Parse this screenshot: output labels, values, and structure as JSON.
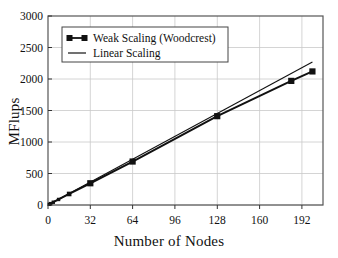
{
  "chart_data": {
    "type": "line",
    "title": "",
    "xlabel": "Number of Nodes",
    "ylabel": "MFlups",
    "xlim": [
      0,
      208
    ],
    "ylim": [
      0,
      3000
    ],
    "xticks": [
      0,
      32,
      64,
      96,
      128,
      160,
      192
    ],
    "yticks": [
      0,
      500,
      1000,
      1500,
      2000,
      2500,
      3000
    ],
    "xtick_labels": [
      "0",
      "32",
      "64",
      "96",
      "128",
      "160",
      "192"
    ],
    "ytick_labels": [
      "0",
      "500",
      "1000",
      "1500",
      "2000",
      "2500",
      "3000"
    ],
    "grid": true,
    "legend_position": "upper-left",
    "series": [
      {
        "name": "Weak Scaling (Woodcrest)",
        "marker": "square",
        "color": "#111111",
        "x": [
          1,
          2,
          4,
          8,
          16,
          32,
          64,
          128,
          184,
          200
        ],
        "y": [
          11,
          22,
          44,
          88,
          175,
          345,
          690,
          1410,
          1970,
          2120
        ]
      },
      {
        "name": "Linear Scaling",
        "marker": "none",
        "color": "#111111",
        "x": [
          0,
          200
        ],
        "y": [
          0,
          2270
        ]
      }
    ]
  },
  "legend": {
    "items": [
      {
        "label": "Weak Scaling (Woodcrest)",
        "style": "line-with-square-marker"
      },
      {
        "label": "Linear Scaling",
        "style": "plain-line"
      }
    ]
  },
  "axes": {
    "x_title": "Number of Nodes",
    "y_title": "MFlups"
  },
  "colors": {
    "line": "#111111",
    "grid": "#c9c9c9",
    "frame": "#555555",
    "background": "#ffffff"
  }
}
